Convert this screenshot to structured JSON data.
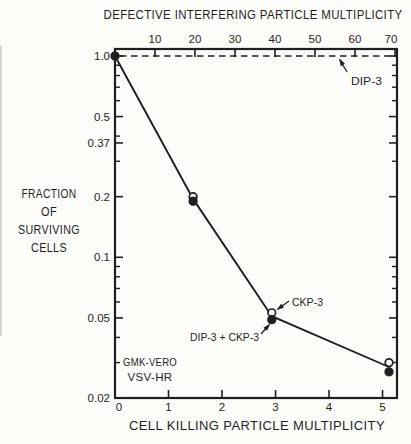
{
  "figure": {
    "background": "#fcfcf9",
    "ink": "#1f1f1f"
  },
  "chart_data": {
    "type": "line",
    "y_scale": "log",
    "y_range": [
      0.02,
      1.0
    ],
    "x_top": {
      "label": "DEFECTIVE INTERFERING PARTICLE MULTIPLICITY",
      "min": 0,
      "max": 70.5,
      "ticks": [
        {
          "v": 10,
          "t": "10"
        },
        {
          "v": 20,
          "t": "20"
        },
        {
          "v": 30,
          "t": "30"
        },
        {
          "v": 40,
          "t": "40"
        },
        {
          "v": 50,
          "t": "50"
        },
        {
          "v": 60,
          "t": "60"
        },
        {
          "v": 70,
          "t": "70",
          "dx": -4
        }
      ]
    },
    "x_bottom": {
      "label": "CELL KILLING PARTICLE MULTIPLICITY",
      "min": 0,
      "max": 5.27,
      "ticks": [
        {
          "v": 0,
          "t": "0",
          "dx": 4
        },
        {
          "v": 1,
          "t": "1"
        },
        {
          "v": 2,
          "t": "2"
        },
        {
          "v": 3,
          "t": "3"
        },
        {
          "v": 4,
          "t": "4"
        },
        {
          "v": 5,
          "t": "5"
        }
      ]
    },
    "y_left": {
      "label_lines": [
        "FRACTION",
        "OF",
        "SURVIVING",
        "CELLS"
      ],
      "ticks": [
        {
          "v": 1.0,
          "t": "1.0"
        },
        {
          "v": 0.5,
          "t": "0.5"
        },
        {
          "v": 0.37,
          "t": "0.37"
        },
        {
          "v": 0.2,
          "t": "0.2"
        },
        {
          "v": 0.1,
          "t": "0.1"
        },
        {
          "v": 0.05,
          "t": "0.05"
        },
        {
          "v": 0.02,
          "t": "0.02"
        }
      ],
      "minor_ticks": [
        0.9,
        0.8,
        0.7,
        0.6,
        0.4,
        0.3,
        0.09,
        0.08,
        0.07,
        0.06,
        0.04,
        0.03
      ]
    },
    "reference_line": {
      "y": 1.0,
      "style": "dashed",
      "label": "DIP-3"
    },
    "series": [
      {
        "name": "open-circle-series",
        "marker": "open-circle",
        "points": [
          [
            1.46,
            0.2
          ],
          [
            2.93,
            0.053
          ],
          [
            5.12,
            0.03
          ]
        ]
      },
      {
        "name": "filled-circle-series",
        "marker": "filled-circle",
        "points": [
          [
            0,
            1.0
          ],
          [
            1.46,
            0.19
          ],
          [
            2.93,
            0.049
          ],
          [
            5.12,
            0.027
          ]
        ]
      }
    ],
    "line_path": [
      [
        0,
        1.0
      ],
      [
        1.46,
        0.195
      ],
      [
        2.93,
        0.051
      ],
      [
        5.12,
        0.0285
      ]
    ],
    "annotations": [
      {
        "text": "DIP-3",
        "lx": 351,
        "ly": 85,
        "w": 31,
        "arrow": [
          347,
          72,
          340,
          60
        ]
      },
      {
        "text": "CKP-3",
        "lx": 292,
        "ly": 306,
        "w": 31,
        "arrow": [
          289,
          301,
          278,
          309
        ]
      },
      {
        "text": "DIP-3 + CKP-3",
        "lx": 190,
        "ly": 341,
        "w": 69,
        "arrow": [
          261,
          334,
          269,
          325
        ]
      }
    ],
    "inset_label_lines": [
      "GMK-VERO",
      "VSV-HR"
    ]
  }
}
